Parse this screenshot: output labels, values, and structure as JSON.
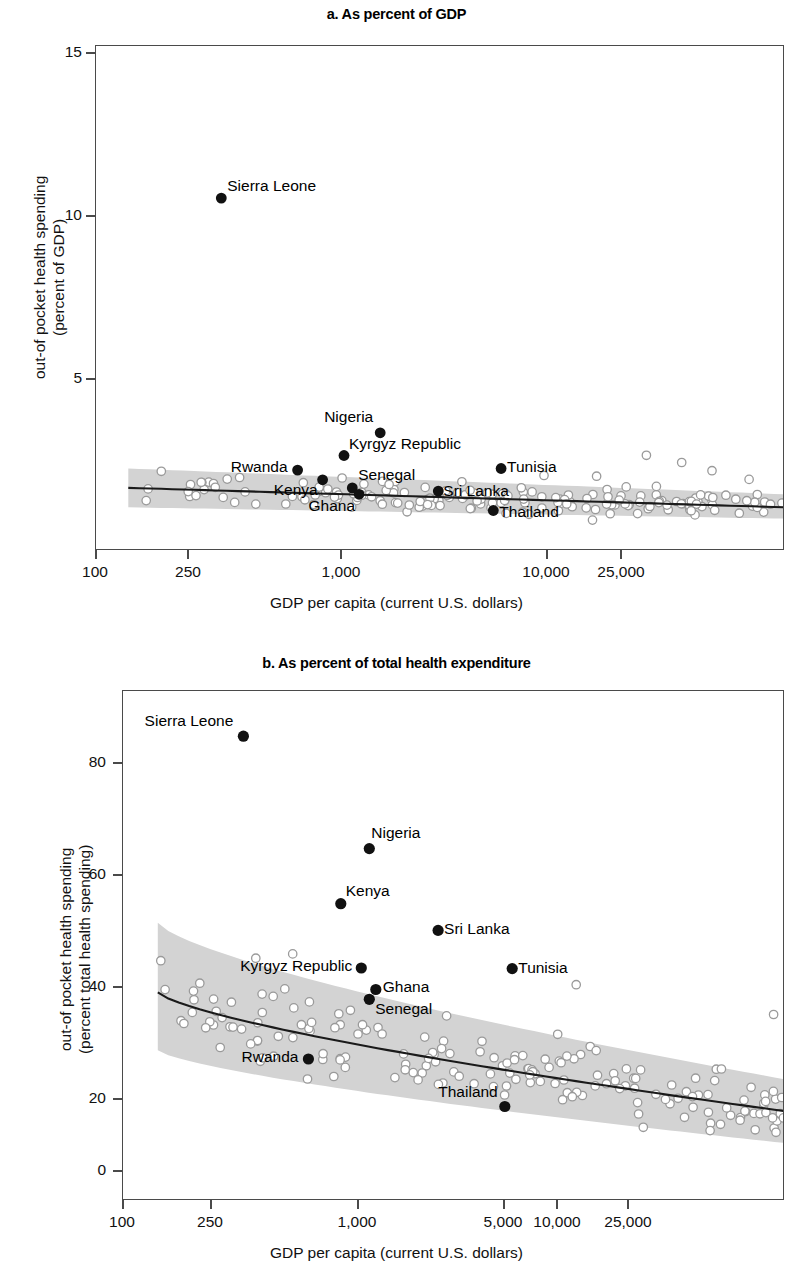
{
  "figure": {
    "panels": [
      {
        "id": "a",
        "title": "a. As percent of GDP"
      },
      {
        "id": "b",
        "title": "b. As percent of total health expenditure"
      }
    ],
    "colors": {
      "point_highlight": "#111111",
      "point_other": "#9a9a9a",
      "band": "#d3d3d3",
      "line": "#1a1a1a",
      "frame": "#4a4a4a"
    }
  },
  "chart_data": [
    {
      "type": "scatter",
      "panel": "a",
      "title": "a. As percent of GDP",
      "xlabel": "GDP per capita (current U.S. dollars)",
      "ylabel": "out-of pocket health spending (percent of GDP)",
      "ylabel_line1": "out-of pocket health spending",
      "ylabel_line2": "(percent of GDP)",
      "xscale": "log",
      "xlim": [
        100,
        60000
      ],
      "ylim": [
        0,
        15.6
      ],
      "xticks": [
        100,
        250,
        1000,
        10000,
        25000
      ],
      "xtick_labels": [
        "100",
        "250",
        "1,000",
        "10,000",
        "25,000"
      ],
      "yticks": [
        5,
        10,
        15
      ],
      "ytick_labels": [
        "5",
        "10",
        "15"
      ],
      "grid": false,
      "legend": "none",
      "trend_line": {
        "description": "fitted regression line, slightly downward sloping",
        "y_at_xmin": 1.95,
        "y_at_xmax": 1.35
      },
      "confidence_band": {
        "description": "shaded 95% confidence interval",
        "upper_at_xmin": 2.55,
        "lower_at_xmin": 1.35,
        "upper_at_xmax": 1.75,
        "lower_at_xmax": 1.0
      },
      "labeled_points": [
        {
          "name": "Sierra Leone",
          "x": 320,
          "y": 10.9,
          "label_side": "right"
        },
        {
          "name": "Nigeria",
          "x": 1400,
          "y": 3.65,
          "label_side": "above-left"
        },
        {
          "name": "Kyrgyz Republic",
          "x": 1000,
          "y": 2.95,
          "label_side": "right"
        },
        {
          "name": "Rwanda",
          "x": 650,
          "y": 2.5,
          "label_side": "left"
        },
        {
          "name": "Kenya",
          "x": 820,
          "y": 2.2,
          "label_side": "below"
        },
        {
          "name": "Senegal",
          "x": 1080,
          "y": 1.95,
          "label_side": "right"
        },
        {
          "name": "Ghana",
          "x": 1150,
          "y": 1.75,
          "label_side": "below"
        },
        {
          "name": "Sri Lanka",
          "x": 2400,
          "y": 1.85,
          "label_side": "right"
        },
        {
          "name": "Tunisia",
          "x": 4300,
          "y": 2.55,
          "label_side": "right"
        },
        {
          "name": "Thailand",
          "x": 4000,
          "y": 1.25,
          "label_side": "right"
        }
      ],
      "other_points_count": 180
    },
    {
      "type": "scatter",
      "panel": "b",
      "title": "b. As percent of total health expenditure",
      "xlabel": "GDP per capita (current U.S. dollars)",
      "ylabel": "out-of pocket health spending (percent total health spending)",
      "ylabel_line1": "out-of pocket health spending",
      "ylabel_line2": "(percent total health spending)",
      "xscale": "log",
      "xlim": [
        100,
        60000
      ],
      "ylim": [
        0,
        88
      ],
      "xticks": [
        100,
        250,
        1000,
        5000,
        10000,
        25000
      ],
      "xtick_labels": [
        "100",
        "250",
        "1,000",
        "5,000",
        "10,000",
        "25,000"
      ],
      "yticks": [
        0,
        20,
        40,
        60,
        80
      ],
      "ytick_labels": [
        "0",
        "20",
        "40",
        "60",
        "80"
      ],
      "grid": false,
      "legend": "none",
      "trend_line": {
        "description": "fitted regression curve, downward sloping",
        "y_at_xmin": 36,
        "y_at_xmax": 15.5
      },
      "confidence_band": {
        "description": "shaded 95% confidence interval",
        "upper_at_xmin": 48,
        "lower_at_xmin": 26,
        "upper_at_xmax": 21,
        "lower_at_xmax": 10
      },
      "labeled_points": [
        {
          "name": "Sierra Leone",
          "x": 320,
          "y": 80.2,
          "label_side": "left"
        },
        {
          "name": "Nigeria",
          "x": 1080,
          "y": 60.8,
          "label_side": "above-right"
        },
        {
          "name": "Kenya",
          "x": 820,
          "y": 51.3,
          "label_side": "right"
        },
        {
          "name": "Sri Lanka",
          "x": 2100,
          "y": 46.7,
          "label_side": "right"
        },
        {
          "name": "Kyrgyz Republic",
          "x": 1000,
          "y": 40.2,
          "label_side": "left"
        },
        {
          "name": "Tunisia",
          "x": 4300,
          "y": 40.1,
          "label_side": "right"
        },
        {
          "name": "Ghana",
          "x": 1150,
          "y": 36.5,
          "label_side": "right"
        },
        {
          "name": "Senegal",
          "x": 1080,
          "y": 34.8,
          "label_side": "below-right"
        },
        {
          "name": "Rwanda",
          "x": 600,
          "y": 24.5,
          "label_side": "left"
        },
        {
          "name": "Thailand",
          "x": 4000,
          "y": 16.3,
          "label_side": "above-left"
        }
      ],
      "other_points_count": 180
    }
  ]
}
